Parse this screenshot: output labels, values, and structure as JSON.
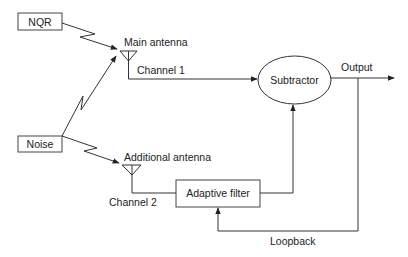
{
  "diagram": {
    "sources": {
      "nqr": "NQR",
      "noise": "Noise"
    },
    "antennas": {
      "main": "Main antenna",
      "additional": "Additional antenna"
    },
    "channels": {
      "channel1": "Channel 1",
      "channel2": "Channel 2"
    },
    "blocks": {
      "subtractor": "Subtractor",
      "adaptive_filter": "Adaptive filter"
    },
    "signals": {
      "output": "Output",
      "loopback": "Loopback"
    },
    "colors": {
      "line": "#333333",
      "text": "#222222",
      "background": "#ffffff"
    }
  }
}
